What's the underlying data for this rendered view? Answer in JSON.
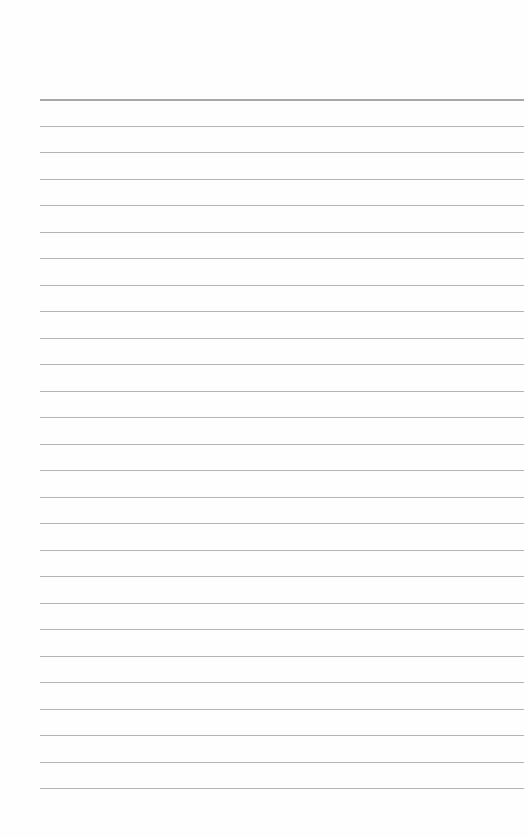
{
  "paper": {
    "type": "lined-paper",
    "line_count": 27,
    "first_line_y": 99,
    "line_spacing": 26.5,
    "line_left": 40,
    "line_width": 484,
    "line_color": "#b4b4b4",
    "background_color": "#fefefe"
  }
}
